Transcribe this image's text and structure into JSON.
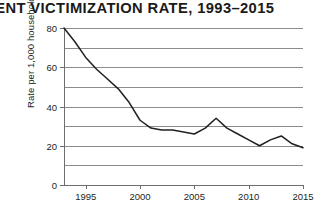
{
  "chart_data": {
    "type": "line",
    "title": "OLENT VICTIMIZATION RATE, 1993–2015",
    "xlabel": "",
    "ylabel": "Rate per 1,000 households",
    "xlim": [
      1993,
      2015
    ],
    "ylim": [
      0,
      80
    ],
    "grid": true,
    "grid_interval": 10,
    "legend": "none",
    "y_ticks": [
      0,
      20,
      40,
      60,
      80
    ],
    "y_tick_labels": [
      "0",
      "20",
      "40",
      "60",
      "80"
    ],
    "x_ticks": [
      1995,
      2000,
      2005,
      2010,
      2015
    ],
    "x_tick_labels": [
      "1995",
      "2000",
      "2005",
      "2010",
      "2015"
    ],
    "x": [
      1993,
      1994,
      1995,
      1996,
      1997,
      1998,
      1999,
      2000,
      2001,
      2002,
      2003,
      2004,
      2005,
      2006,
      2007,
      2008,
      2009,
      2010,
      2011,
      2012,
      2013,
      2014,
      2015
    ],
    "values": [
      80,
      73,
      65,
      59,
      54,
      49,
      42,
      33,
      29,
      28,
      28,
      27,
      26,
      29,
      34,
      29,
      26,
      23,
      20,
      23,
      25,
      21,
      19
    ],
    "series": [
      {
        "name": "Violent victimization rate",
        "color": "#231f20",
        "values": [
          80,
          73,
          65,
          59,
          54,
          49,
          42,
          33,
          29,
          28,
          28,
          27,
          26,
          29,
          34,
          29,
          26,
          23,
          20,
          23,
          25,
          21,
          19
        ]
      }
    ],
    "source": ""
  },
  "figure": {
    "title": "OLENT VICTIMIZATION RATE, 1993–2015",
    "y_axis_title": "Rate per 1,000 households",
    "source_note": ""
  }
}
